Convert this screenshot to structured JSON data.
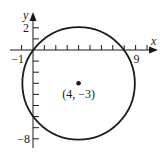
{
  "figure": {
    "type": "circle-on-coordinate-plane",
    "axes": {
      "x_label": "x",
      "y_label": "y",
      "x_tick_labels": [
        {
          "value": -1,
          "text": "−1"
        },
        {
          "value": 9,
          "text": "9"
        }
      ],
      "y_tick_labels": [
        {
          "value": 2,
          "text": "2"
        },
        {
          "value": -8,
          "text": "−8"
        }
      ],
      "x_range": [
        -1,
        10
      ],
      "y_range": [
        -9,
        3
      ]
    },
    "circle": {
      "center": [
        4,
        -3
      ],
      "radius": 5
    },
    "center_point": {
      "label": "(4, −3)"
    },
    "colors": {
      "stroke": "#1a1a1a",
      "background": "#ffffff"
    }
  }
}
